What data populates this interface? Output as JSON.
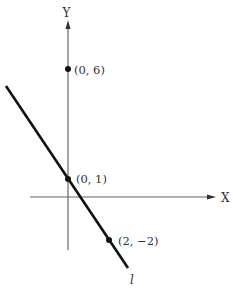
{
  "figure": {
    "type": "coordinate-plane-line",
    "axes": {
      "x_label": "X",
      "y_label": "Y"
    },
    "line": {
      "label": "l",
      "color": "#111111"
    },
    "points": [
      {
        "label": "(0, 6)",
        "x": 0,
        "y": 6
      },
      {
        "label": "(0, 1)",
        "x": 0,
        "y": 1
      },
      {
        "label": "(2, −2)",
        "x": 2,
        "y": -2
      }
    ],
    "colors": {
      "axis": "#666666",
      "line": "#111111",
      "point": "#111111",
      "text": "#333333"
    }
  }
}
